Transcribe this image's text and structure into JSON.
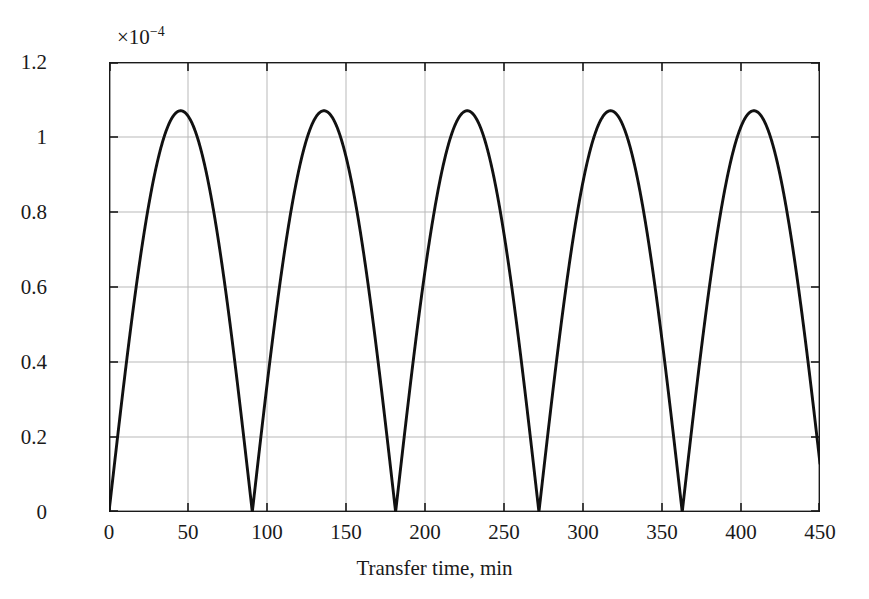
{
  "figure": {
    "background_color": "#ffffff",
    "axis_color": "#1a1a1a",
    "grid_color": "#b9b9b9",
    "curve_color": "#111111"
  },
  "axes": {
    "y_multiplier_text": "×10",
    "y_multiplier_exponent": "−4",
    "y_tick_labels": [
      "0",
      "0.2",
      "0.4",
      "0.6",
      "0.8",
      "1",
      "1.2"
    ],
    "x_tick_labels": [
      "0",
      "50",
      "100",
      "150",
      "200",
      "250",
      "300",
      "350",
      "400",
      "450"
    ]
  },
  "chart_data": {
    "type": "line",
    "title": "",
    "subtitle": "",
    "xlabel": "Transfer time, min",
    "ylabel": "Eccentricity",
    "y_multiplier": "×10⁻⁴",
    "xlim": [
      0,
      450
    ],
    "ylim": [
      0,
      1.2
    ],
    "xticks": [
      0,
      50,
      100,
      150,
      200,
      250,
      300,
      350,
      400,
      450
    ],
    "yticks": [
      0,
      0.2,
      0.4,
      0.6,
      0.8,
      1,
      1.2
    ],
    "grid": true,
    "legend": "none",
    "annotations": [],
    "series": [
      {
        "name": "Eccentricity",
        "description": "Rectified sinusoidal oscillation of orbital eccentricity during low-thrust transfer",
        "period_min": 90.7,
        "peak_value_e4": 1.07,
        "zero_crossings_min": [
          0,
          91,
          182,
          272,
          363
        ],
        "peak_locations_min": [
          45,
          136,
          227,
          317,
          408
        ],
        "end_value_e4": 0.12,
        "x": [
          0,
          5,
          10,
          15,
          20,
          25,
          30,
          35,
          40,
          45,
          50,
          55,
          60,
          65,
          70,
          75,
          80,
          85,
          91,
          96,
          101,
          106,
          111,
          116,
          121,
          126,
          131,
          136,
          141,
          146,
          151,
          156,
          161,
          166,
          171,
          176,
          182,
          187,
          192,
          197,
          202,
          207,
          212,
          217,
          222,
          227,
          232,
          237,
          242,
          247,
          252,
          257,
          262,
          267,
          272,
          277,
          282,
          287,
          292,
          297,
          302,
          307,
          312,
          317,
          322,
          327,
          332,
          337,
          342,
          347,
          352,
          357,
          363,
          368,
          373,
          378,
          383,
          388,
          393,
          398,
          403,
          408,
          413,
          418,
          423,
          428,
          433,
          438,
          443,
          448,
          450
        ],
        "y": [
          0.0,
          0.19,
          0.37,
          0.54,
          0.7,
          0.83,
          0.94,
          1.02,
          1.06,
          1.07,
          1.06,
          1.02,
          0.94,
          0.83,
          0.7,
          0.54,
          0.37,
          0.19,
          0.0,
          0.19,
          0.37,
          0.54,
          0.7,
          0.83,
          0.94,
          1.02,
          1.06,
          1.07,
          1.06,
          1.02,
          0.94,
          0.83,
          0.7,
          0.54,
          0.37,
          0.19,
          0.0,
          0.19,
          0.37,
          0.54,
          0.7,
          0.83,
          0.94,
          1.02,
          1.06,
          1.07,
          1.06,
          1.02,
          0.94,
          0.83,
          0.7,
          0.54,
          0.37,
          0.19,
          0.0,
          0.19,
          0.37,
          0.54,
          0.7,
          0.83,
          0.94,
          1.02,
          1.06,
          1.07,
          1.06,
          1.02,
          0.94,
          0.83,
          0.7,
          0.54,
          0.37,
          0.19,
          0.0,
          0.19,
          0.37,
          0.54,
          0.7,
          0.83,
          0.94,
          1.02,
          1.06,
          1.07,
          1.06,
          1.02,
          0.94,
          0.83,
          0.7,
          0.54,
          0.37,
          0.19,
          0.12
        ]
      }
    ]
  }
}
